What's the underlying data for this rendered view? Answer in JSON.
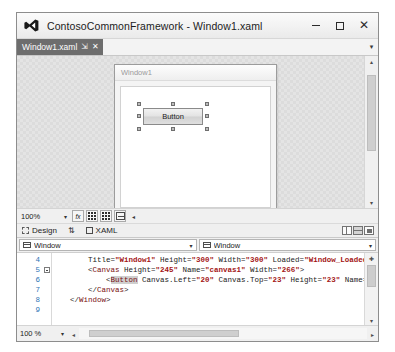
{
  "window": {
    "title": "ContosoCommonFramework - Window1.xaml",
    "app_icon": "visual-studio-icon",
    "controls": {
      "minimize": "—",
      "maximize": "□",
      "close": "✕"
    }
  },
  "tabstrip": {
    "tabs": [
      {
        "label": "Window1.xaml",
        "pin": "⇲",
        "close": "✕",
        "active": true
      }
    ],
    "overflow_chevron": "▾"
  },
  "designer": {
    "preview": {
      "title": "Window1",
      "button": {
        "content": "Button",
        "selected": true
      }
    },
    "vscroll": {
      "up": "▴",
      "down": "▾"
    },
    "hscroll": {
      "left": "◂",
      "right": "▸"
    }
  },
  "zoom_toolbar": {
    "zoom_value": "100%",
    "zoom_arrow": "▾",
    "buttons": [
      {
        "name": "effects-button",
        "label": "fx"
      },
      {
        "name": "show-grid-button",
        "label": ""
      },
      {
        "name": "grid-rails-button",
        "label": ""
      },
      {
        "name": "snap-to-grid-button",
        "label": ""
      }
    ],
    "caret": "◂"
  },
  "view_tabs": {
    "design": {
      "label": "Design",
      "icon": "design-view-icon"
    },
    "swap": {
      "icon": "swap-panes-icon",
      "glyph": "⇅"
    },
    "xaml": {
      "label": "XAML",
      "icon": "xaml-view-icon"
    },
    "layout_buttons": [
      {
        "name": "vertical-split-button",
        "selected": false
      },
      {
        "name": "horizontal-split-button",
        "selected": true
      },
      {
        "name": "collapse-pane-button",
        "selected": false
      }
    ]
  },
  "member_dropdowns": [
    {
      "name": "type-dropdown",
      "label": "Window",
      "arrow": "▾",
      "icon": "class-icon"
    },
    {
      "name": "member-dropdown",
      "label": "Window",
      "arrow": "▾",
      "icon": "class-icon"
    }
  ],
  "editor": {
    "line_numbers": [
      "4",
      "5",
      "6",
      "7",
      "8",
      "9"
    ],
    "fold_markers": [
      false,
      true,
      false,
      false,
      false,
      false
    ],
    "lines": [
      {
        "indent": 8,
        "segments": [
          {
            "t": "Title=",
            "c": "plain"
          },
          {
            "t": "\"Window1\"",
            "c": "str"
          },
          {
            "t": " Height=",
            "c": "plain"
          },
          {
            "t": "\"300\"",
            "c": "str"
          },
          {
            "t": " Width=",
            "c": "plain"
          },
          {
            "t": "\"300\"",
            "c": "str"
          },
          {
            "t": " Loaded=",
            "c": "plain"
          },
          {
            "t": "\"Window_Loaded\"",
            "c": "str"
          },
          {
            "t": ">",
            "c": "punc"
          }
        ]
      },
      {
        "indent": 8,
        "segments": [
          {
            "t": "<",
            "c": "punc"
          },
          {
            "t": "Canvas",
            "c": "el"
          },
          {
            "t": " Height=",
            "c": "plain"
          },
          {
            "t": "\"245\"",
            "c": "str"
          },
          {
            "t": " Name=",
            "c": "plain"
          },
          {
            "t": "\"canvas1\"",
            "c": "str"
          },
          {
            "t": " Width=",
            "c": "plain"
          },
          {
            "t": "\"266\"",
            "c": "str"
          },
          {
            "t": ">",
            "c": "punc"
          }
        ]
      },
      {
        "indent": 12,
        "segments": [
          {
            "t": "<",
            "c": "punc"
          },
          {
            "t": "Button",
            "c": "elsel"
          },
          {
            "t": " Canvas.Left=",
            "c": "plain"
          },
          {
            "t": "\"20\"",
            "c": "str"
          },
          {
            "t": " Canvas.Top=",
            "c": "plain"
          },
          {
            "t": "\"23\"",
            "c": "str"
          },
          {
            "t": " Height=",
            "c": "plain"
          },
          {
            "t": "\"23\"",
            "c": "str"
          },
          {
            "t": " Name=",
            "c": "plain"
          },
          {
            "t": "\"button1\"",
            "c": "str"
          }
        ]
      },
      {
        "indent": 8,
        "segments": [
          {
            "t": "</",
            "c": "punc"
          },
          {
            "t": "Canvas",
            "c": "el"
          },
          {
            "t": ">",
            "c": "punc"
          }
        ]
      },
      {
        "indent": 4,
        "segments": [
          {
            "t": "</",
            "c": "punc"
          },
          {
            "t": "Window",
            "c": "el"
          },
          {
            "t": ">",
            "c": "punc"
          }
        ]
      },
      {
        "indent": 0,
        "segments": []
      }
    ],
    "vscroll": {
      "up": "✚",
      "down": "▾"
    }
  },
  "status_bar": {
    "zoom_value": "100 %",
    "zoom_arrow": "▾",
    "hscroll": {
      "left": "◂",
      "right": "▸"
    }
  }
}
